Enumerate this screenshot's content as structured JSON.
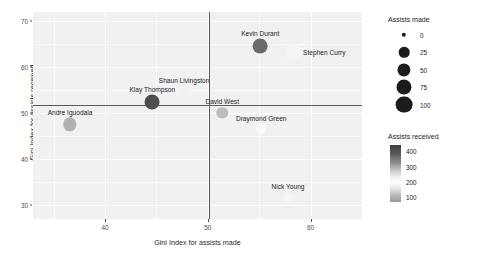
{
  "chart_data": {
    "type": "scatter",
    "title": "",
    "xlabel": "Gini Index for assists made",
    "ylabel": "Gini Index for assists received",
    "xlim": [
      33,
      65
    ],
    "ylim": [
      27,
      72
    ],
    "xticks": [
      40,
      50,
      60
    ],
    "yticks": [
      30,
      40,
      50,
      60,
      70
    ],
    "grid": true,
    "reference_lines": {
      "vertical_x": 50.1,
      "horizontal_y": 51.8
    },
    "points": [
      {
        "label": "Andre Iguodala",
        "x": 36.6,
        "y": 47.6,
        "assists_made": 53,
        "assists_received": 268
      },
      {
        "label": "Klay Thompson",
        "x": 44.6,
        "y": 52.5,
        "assists_made": 72,
        "assists_received": 392
      },
      {
        "label": "Shaun Livingston",
        "x": 47.7,
        "y": 54.6,
        "assists_made": 40,
        "assists_received": 183
      },
      {
        "label": "David West",
        "x": 51.4,
        "y": 50.1,
        "assists_made": 33,
        "assists_received": 128
      },
      {
        "label": "Kevin Durant",
        "x": 55.1,
        "y": 64.6,
        "assists_made": 70,
        "assists_received": 346
      },
      {
        "label": "Stephen Curry",
        "x": 58.4,
        "y": 63.3,
        "assists_made": 100,
        "assists_received": 205
      },
      {
        "label": "Draymond Green",
        "x": 55.2,
        "y": 46.5,
        "assists_made": 20,
        "assists_received": 197
      },
      {
        "label": "Nick Young",
        "x": 57.8,
        "y": 31.7,
        "assists_made": 12,
        "assists_received": 190
      }
    ],
    "legends": [
      {
        "name": "size",
        "title": "Assists made",
        "breaks": [
          0,
          25,
          50,
          75,
          100
        ]
      },
      {
        "name": "color",
        "title": "Assists received",
        "breaks": [
          400,
          300,
          200,
          100
        ],
        "gradient": [
          "#3d3d3d",
          "#fdfdfd",
          "#9c9c9c"
        ]
      }
    ]
  },
  "axes": {
    "y": {
      "title": "Gini Index for assists received",
      "ticks": [
        "70",
        "60",
        "50",
        "40",
        "30"
      ]
    },
    "x": {
      "title": "Gini Index for assists made",
      "ticks": [
        "40",
        "50",
        "60"
      ]
    }
  },
  "legend_size": {
    "title": "Assists made",
    "items": [
      {
        "label": "0"
      },
      {
        "label": "25"
      },
      {
        "label": "50"
      },
      {
        "label": "75"
      },
      {
        "label": "100"
      }
    ]
  },
  "legend_color": {
    "title": "Assists received",
    "items": [
      {
        "label": "400"
      },
      {
        "label": "300"
      },
      {
        "label": "200"
      },
      {
        "label": "100"
      }
    ]
  },
  "colors": {
    "panel_background": "#f1f1f1",
    "gridline": "#ffffff",
    "reference_line": "#595959",
    "text": "#1a1a1a"
  }
}
